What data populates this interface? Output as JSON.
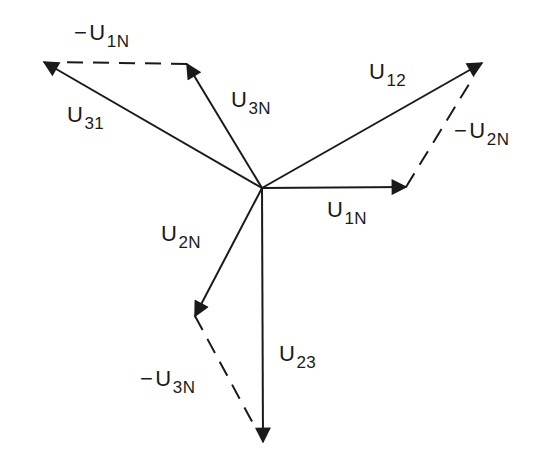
{
  "diagram": {
    "stroke_color": "#1a1a1a",
    "origin": [
      262,
      188
    ],
    "phasors": [
      {
        "id": "U1N",
        "type": "solid",
        "from": [
          262,
          188
        ],
        "to": [
          406,
          187
        ]
      },
      {
        "id": "U2N",
        "type": "solid",
        "from": [
          262,
          188
        ],
        "to": [
          195,
          316
        ]
      },
      {
        "id": "U3N",
        "type": "solid",
        "from": [
          262,
          188
        ],
        "to": [
          187,
          64
        ]
      },
      {
        "id": "U12",
        "type": "solid",
        "from": [
          262,
          188
        ],
        "to": [
          482,
          63
        ]
      },
      {
        "id": "U23",
        "type": "solid",
        "from": [
          262,
          188
        ],
        "to": [
          263,
          442
        ]
      },
      {
        "id": "U31",
        "type": "solid",
        "from": [
          262,
          188
        ],
        "to": [
          44,
          62
        ]
      },
      {
        "id": "-U1N",
        "type": "dashed",
        "from": [
          187,
          64
        ],
        "to": [
          44,
          62
        ]
      },
      {
        "id": "-U2N",
        "type": "dashed",
        "from": [
          406,
          187
        ],
        "to": [
          482,
          63
        ]
      },
      {
        "id": "-U3N",
        "type": "dashed",
        "from": [
          195,
          316
        ],
        "to": [
          263,
          442
        ]
      }
    ],
    "labels": {
      "neg_u1n": {
        "neg": "−",
        "main": "U",
        "sub": "1N"
      },
      "u31": {
        "main": "U",
        "sub": "31"
      },
      "u3n": {
        "main": "U",
        "sub": "3N"
      },
      "u12": {
        "main": "U",
        "sub": "12"
      },
      "neg_u2n": {
        "neg": "−",
        "main": "U",
        "sub": "2N"
      },
      "u1n": {
        "main": "U",
        "sub": "1N"
      },
      "u2n": {
        "main": "U",
        "sub": "2N"
      },
      "u23": {
        "main": "U",
        "sub": "23"
      },
      "neg_u3n": {
        "neg": "−",
        "main": "U",
        "sub": "3N"
      }
    }
  }
}
